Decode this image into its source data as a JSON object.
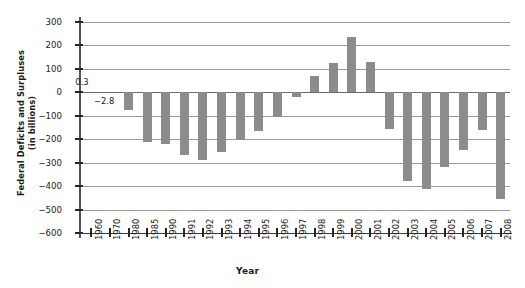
{
  "chart_data": {
    "type": "bar",
    "title": "",
    "xlabel": "Year",
    "ylabel": "Federal Deficits and Surpluses (in billions)",
    "ylabel_line1": "Federal Deficits and Surpluses",
    "ylabel_line2": "(in billions)",
    "ylim": [
      -600,
      300
    ],
    "ytick_step": 100,
    "yticks": [
      300,
      200,
      100,
      0,
      -100,
      -200,
      -300,
      -400,
      -500,
      -600
    ],
    "ytick_labels": [
      "300",
      "200",
      "100",
      "0",
      "-100",
      "-200",
      "-300",
      "-400",
      "-500",
      "-600"
    ],
    "grid": true,
    "legend": false,
    "bar_color": "#8c8c8c",
    "gridline_color": "#9a9a9a",
    "categories": [
      "1960",
      "1970",
      "1980",
      "1985",
      "1990",
      "1991",
      "1992",
      "1993",
      "1994",
      "1995",
      "1996",
      "1997",
      "1998",
      "1999",
      "2000",
      "2001",
      "2002",
      "2003",
      "2004",
      "2005",
      "2006",
      "2007",
      "2008"
    ],
    "values": [
      0.3,
      -2.8,
      -74,
      -212,
      -221,
      -269,
      -290,
      -255,
      -203,
      -164,
      -107,
      -22,
      69,
      126,
      236,
      128,
      -158,
      -378,
      -413,
      -318,
      -248,
      -162,
      -455
    ],
    "annotations": [
      {
        "label": "0.3",
        "category": "1960",
        "value": 0.3
      },
      {
        "label": "-2.8",
        "category": "1970",
        "value": -2.8
      }
    ]
  }
}
